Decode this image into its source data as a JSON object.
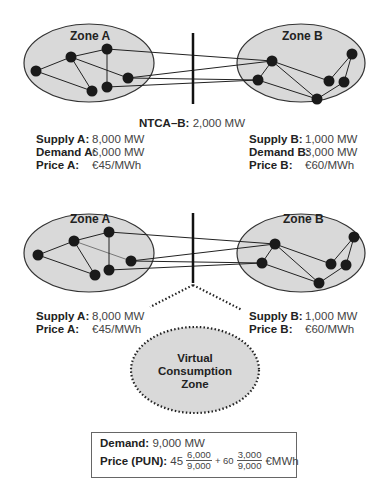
{
  "top_diagram": {
    "zone_a_label": "Zone A",
    "zone_b_label": "Zone B",
    "ntc_key": "NTCA–B:",
    "ntc_value": "2,000 MW",
    "zone_a": {
      "supply_key": "Supply A:",
      "supply_value": "8,000 MW",
      "demand_key": "Demand A:",
      "demand_value": "6,000 MW",
      "price_key": "Price A:",
      "price_value": "€45/MWh"
    },
    "zone_b": {
      "supply_key": "Supply B:",
      "supply_value": "1,000 MW",
      "demand_key": "Demand B:",
      "demand_value": "3,000 MW",
      "price_key": "Price B:",
      "price_value": "€60/MWh"
    }
  },
  "bottom_diagram": {
    "zone_a_label": "Zone A",
    "zone_b_label": "Zone B",
    "zone_a": {
      "supply_key": "Supply A:",
      "supply_value": "8,000 MW",
      "price_key": "Price A:",
      "price_value": "€45/MWh"
    },
    "zone_b": {
      "supply_key": "Supply B:",
      "supply_value": "1,000 MW",
      "price_key": "Price B:",
      "price_value": "€60/MWh"
    },
    "virtual_zone": {
      "line1": "Virtual",
      "line2": "Consumption",
      "line3": "Zone"
    },
    "pun_box": {
      "demand_key": "Demand:",
      "demand_value": "9,000 MW",
      "price_key": "Price (PUN):",
      "term1_coef": "45",
      "term1_num": "6,000",
      "term1_den": "9,000",
      "plus": "+ 60",
      "term2_num": "3,000",
      "term2_den": "9,000",
      "unit": "€MWh"
    }
  },
  "colors": {
    "zone_fill": "#d9d9d9",
    "outline": "#333333",
    "node": "#1a1a1a"
  }
}
